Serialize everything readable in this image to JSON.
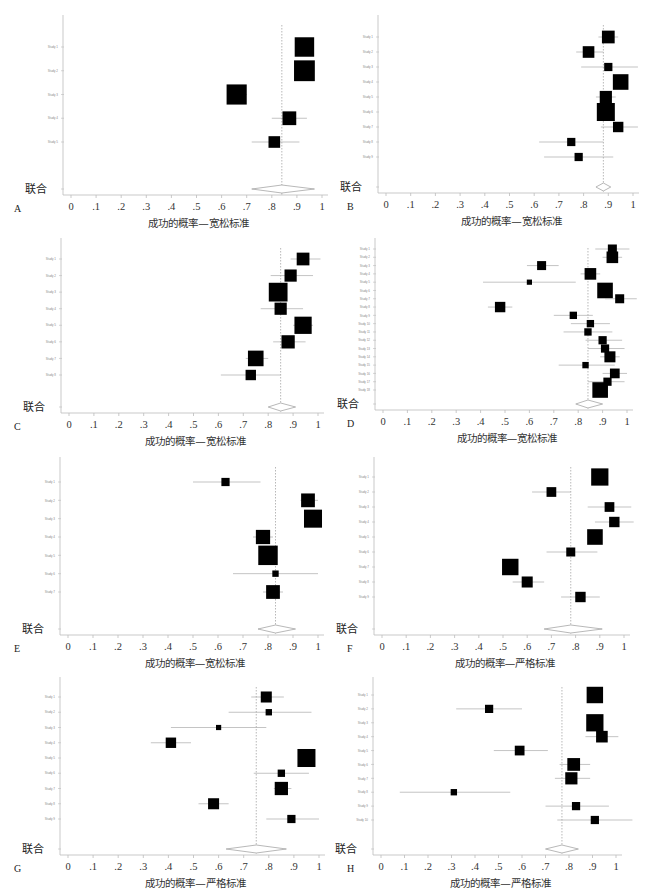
{
  "figure": {
    "pooled_label": "联合",
    "xlabel_lenient": "成功的概率—宽松标准",
    "xlabel_strict": "成功的概率—严格标准",
    "xticks": [
      "0",
      ".1",
      ".2",
      ".3",
      ".4",
      ".5",
      ".6",
      ".7",
      ".8",
      ".9",
      "1"
    ]
  },
  "chart_data": [
    {
      "panel": "A",
      "type": "forest",
      "xlabel": "成功的概率—宽松标准",
      "xlim": [
        0,
        1
      ],
      "reference_line": 0.84,
      "studies": [
        {
          "label": "Study 1",
          "est": 0.93,
          "lo": 0.9,
          "hi": 0.96,
          "weight": 14
        },
        {
          "label": "Study 2",
          "est": 0.93,
          "lo": 0.89,
          "hi": 0.97,
          "weight": 16
        },
        {
          "label": "Study 3",
          "est": 0.66,
          "lo": 0.63,
          "hi": 0.7,
          "weight": 15
        },
        {
          "label": "Study 4",
          "est": 0.87,
          "lo": 0.8,
          "hi": 0.94,
          "weight": 7
        },
        {
          "label": "Study 5",
          "est": 0.81,
          "lo": 0.72,
          "hi": 0.91,
          "weight": 5
        }
      ],
      "pooled": {
        "est": 0.84,
        "lo": 0.72,
        "hi": 0.97
      }
    },
    {
      "panel": "B",
      "type": "forest",
      "xlabel": "成功的概率—宽松标准",
      "xlim": [
        0,
        1
      ],
      "reference_line": 0.88,
      "studies": [
        {
          "label": "Study 1",
          "est": 0.9,
          "lo": 0.86,
          "hi": 0.94,
          "weight": 6
        },
        {
          "label": "Study 2",
          "est": 0.82,
          "lo": 0.77,
          "hi": 0.88,
          "weight": 5
        },
        {
          "label": "Study 3",
          "est": 0.9,
          "lo": 0.79,
          "hi": 1.02,
          "weight": 2.5
        },
        {
          "label": "Study 4",
          "est": 0.95,
          "lo": 0.93,
          "hi": 0.98,
          "weight": 9
        },
        {
          "label": "Study 5",
          "est": 0.89,
          "lo": 0.85,
          "hi": 0.93,
          "weight": 5.5
        },
        {
          "label": "Study 6",
          "est": 0.89,
          "lo": 0.87,
          "hi": 0.91,
          "weight": 12
        },
        {
          "label": "Study 7",
          "est": 0.94,
          "lo": 0.87,
          "hi": 1.02,
          "weight": 4
        },
        {
          "label": "Study 8",
          "est": 0.75,
          "lo": 0.62,
          "hi": 0.88,
          "weight": 2.5
        },
        {
          "label": "Study 9",
          "est": 0.78,
          "lo": 0.64,
          "hi": 0.92,
          "weight": 2.5
        }
      ],
      "pooled": {
        "est": 0.88,
        "lo": 0.85,
        "hi": 0.91
      }
    },
    {
      "panel": "C",
      "type": "forest",
      "xlabel": "成功的概率—宽松标准",
      "xlim": [
        0,
        1
      ],
      "reference_line": 0.85,
      "studies": [
        {
          "label": "Study 1",
          "est": 0.94,
          "lo": 0.89,
          "hi": 1.01,
          "weight": 6
        },
        {
          "label": "Study 2",
          "est": 0.89,
          "lo": 0.81,
          "hi": 0.98,
          "weight": 5.5
        },
        {
          "label": "Study 3",
          "est": 0.84,
          "lo": 0.82,
          "hi": 0.87,
          "weight": 13
        },
        {
          "label": "Study 4",
          "est": 0.85,
          "lo": 0.77,
          "hi": 0.94,
          "weight": 5.5
        },
        {
          "label": "Study 5",
          "est": 0.94,
          "lo": 0.9,
          "hi": 0.98,
          "weight": 11
        },
        {
          "label": "Study 6",
          "est": 0.88,
          "lo": 0.82,
          "hi": 0.95,
          "weight": 6.5
        },
        {
          "label": "Study 7",
          "est": 0.75,
          "lo": 0.71,
          "hi": 0.8,
          "weight": 9
        },
        {
          "label": "Study 8",
          "est": 0.73,
          "lo": 0.61,
          "hi": 0.85,
          "weight": 4
        }
      ],
      "pooled": {
        "est": 0.85,
        "lo": 0.8,
        "hi": 0.91
      }
    },
    {
      "panel": "D",
      "type": "forest",
      "xlabel": "成功的概率—宽松标准",
      "xlim": [
        0,
        1
      ],
      "reference_line": 0.84,
      "studies": [
        {
          "label": "Study 1",
          "est": 0.94,
          "lo": 0.87,
          "hi": 1.01,
          "weight": 3
        },
        {
          "label": "Study 2",
          "est": 0.94,
          "lo": 0.9,
          "hi": 0.98,
          "weight": 5
        },
        {
          "label": "Study 3",
          "est": 0.65,
          "lo": 0.59,
          "hi": 0.72,
          "weight": 3
        },
        {
          "label": "Study 4",
          "est": 0.85,
          "lo": 0.81,
          "hi": 0.89,
          "weight": 5
        },
        {
          "label": "Study 5",
          "est": 0.6,
          "lo": 0.41,
          "hi": 0.79,
          "weight": 1
        },
        {
          "label": "Study 6",
          "est": 0.91,
          "lo": 0.89,
          "hi": 0.93,
          "weight": 9
        },
        {
          "label": "Study 7",
          "est": 0.97,
          "lo": 0.91,
          "hi": 1.04,
          "weight": 3
        },
        {
          "label": "Study 8",
          "est": 0.48,
          "lo": 0.43,
          "hi": 0.53,
          "weight": 4
        },
        {
          "label": "Study 9",
          "est": 0.78,
          "lo": 0.7,
          "hi": 0.86,
          "weight": 2
        },
        {
          "label": "Study 10",
          "est": 0.85,
          "lo": 0.77,
          "hi": 0.93,
          "weight": 2
        },
        {
          "label": "Study 11",
          "est": 0.84,
          "lo": 0.74,
          "hi": 0.94,
          "weight": 2
        },
        {
          "label": "Study 12",
          "est": 0.9,
          "lo": 0.83,
          "hi": 0.98,
          "weight": 2.5
        },
        {
          "label": "Study 13",
          "est": 0.91,
          "lo": 0.84,
          "hi": 0.99,
          "weight": 2.5
        },
        {
          "label": "Study 14",
          "est": 0.93,
          "lo": 0.89,
          "hi": 0.97,
          "weight": 4.5
        },
        {
          "label": "Study 15",
          "est": 0.83,
          "lo": 0.72,
          "hi": 0.95,
          "weight": 1.5
        },
        {
          "label": "Study 16",
          "est": 0.95,
          "lo": 0.9,
          "hi": 1.0,
          "weight": 3.5
        },
        {
          "label": "Study 17",
          "est": 0.92,
          "lo": 0.84,
          "hi": 0.99,
          "weight": 2.5
        },
        {
          "label": "Study 18",
          "est": 0.89,
          "lo": 0.87,
          "hi": 0.91,
          "weight": 9
        }
      ],
      "pooled": {
        "est": 0.84,
        "lo": 0.79,
        "hi": 0.9
      }
    },
    {
      "panel": "E",
      "type": "forest",
      "xlabel": "成功的概率—宽松标准",
      "xlim": [
        0,
        1
      ],
      "reference_line": 0.83,
      "studies": [
        {
          "label": "Study 1",
          "est": 0.63,
          "lo": 0.5,
          "hi": 0.77,
          "weight": 2.5
        },
        {
          "label": "Study 2",
          "est": 0.96,
          "lo": 0.93,
          "hi": 1.0,
          "weight": 7
        },
        {
          "label": "Study 3",
          "est": 0.98,
          "lo": 0.96,
          "hi": 1.0,
          "weight": 12
        },
        {
          "label": "Study 4",
          "est": 0.78,
          "lo": 0.74,
          "hi": 0.82,
          "weight": 7.5
        },
        {
          "label": "Study 5",
          "est": 0.8,
          "lo": 0.78,
          "hi": 0.83,
          "weight": 14
        },
        {
          "label": "Study 6",
          "est": 0.83,
          "lo": 0.66,
          "hi": 1.0,
          "weight": 1.5
        },
        {
          "label": "Study 7",
          "est": 0.82,
          "lo": 0.78,
          "hi": 0.86,
          "weight": 7
        }
      ],
      "pooled": {
        "est": 0.83,
        "lo": 0.76,
        "hi": 0.91
      }
    },
    {
      "panel": "F",
      "type": "forest",
      "xlabel": "成功的概率—严格标准",
      "xlim": [
        0,
        1
      ],
      "reference_line": 0.78,
      "studies": [
        {
          "label": "Study 1",
          "est": 0.9,
          "lo": 0.88,
          "hi": 0.92,
          "weight": 11
        },
        {
          "label": "Study 2",
          "est": 0.7,
          "lo": 0.62,
          "hi": 0.78,
          "weight": 3.5
        },
        {
          "label": "Study 3",
          "est": 0.94,
          "lo": 0.85,
          "hi": 1.03,
          "weight": 3.5
        },
        {
          "label": "Study 4",
          "est": 0.96,
          "lo": 0.88,
          "hi": 1.04,
          "weight": 4
        },
        {
          "label": "Study 5",
          "est": 0.88,
          "lo": 0.86,
          "hi": 0.9,
          "weight": 9
        },
        {
          "label": "Study 6",
          "est": 0.78,
          "lo": 0.68,
          "hi": 0.89,
          "weight": 3
        },
        {
          "label": "Study 7",
          "est": 0.53,
          "lo": 0.51,
          "hi": 0.55,
          "weight": 10
        },
        {
          "label": "Study 8",
          "est": 0.6,
          "lo": 0.54,
          "hi": 0.67,
          "weight": 4.5
        },
        {
          "label": "Study 9",
          "est": 0.82,
          "lo": 0.74,
          "hi": 0.9,
          "weight": 4
        }
      ],
      "pooled": {
        "est": 0.78,
        "lo": 0.67,
        "hi": 0.91
      }
    },
    {
      "panel": "G",
      "type": "forest",
      "xlabel": "成功的概率—严格标准",
      "xlim": [
        0,
        1
      ],
      "reference_line": 0.75,
      "studies": [
        {
          "label": "Study 1",
          "est": 0.79,
          "lo": 0.73,
          "hi": 0.86,
          "weight": 4.5
        },
        {
          "label": "Study 2",
          "est": 0.8,
          "lo": 0.64,
          "hi": 0.97,
          "weight": 1.5
        },
        {
          "label": "Study 3",
          "est": 0.6,
          "lo": 0.41,
          "hi": 0.79,
          "weight": 1
        },
        {
          "label": "Study 4",
          "est": 0.41,
          "lo": 0.33,
          "hi": 0.49,
          "weight": 4
        },
        {
          "label": "Study 5",
          "est": 0.95,
          "lo": 0.93,
          "hi": 0.97,
          "weight": 12
        },
        {
          "label": "Study 6",
          "est": 0.85,
          "lo": 0.74,
          "hi": 0.96,
          "weight": 2
        },
        {
          "label": "Study 7",
          "est": 0.85,
          "lo": 0.82,
          "hi": 0.89,
          "weight": 6.5
        },
        {
          "label": "Study 8",
          "est": 0.58,
          "lo": 0.52,
          "hi": 0.64,
          "weight": 4.5
        },
        {
          "label": "Study 9",
          "est": 0.89,
          "lo": 0.79,
          "hi": 1.0,
          "weight": 2.5
        }
      ],
      "pooled": {
        "est": 0.75,
        "lo": 0.63,
        "hi": 0.87
      }
    },
    {
      "panel": "H",
      "type": "forest",
      "xlabel": "成功的概率—严格标准",
      "xlim": [
        0,
        1
      ],
      "reference_line": 0.77,
      "studies": [
        {
          "label": "Study 1",
          "est": 0.91,
          "lo": 0.89,
          "hi": 0.93,
          "weight": 10
        },
        {
          "label": "Study 2",
          "est": 0.46,
          "lo": 0.32,
          "hi": 0.6,
          "weight": 2.5
        },
        {
          "label": "Study 3",
          "est": 0.91,
          "lo": 0.89,
          "hi": 0.93,
          "weight": 11
        },
        {
          "label": "Study 4",
          "est": 0.94,
          "lo": 0.87,
          "hi": 1.01,
          "weight": 5
        },
        {
          "label": "Study 5",
          "est": 0.59,
          "lo": 0.48,
          "hi": 0.71,
          "weight": 3.5
        },
        {
          "label": "Study 6",
          "est": 0.82,
          "lo": 0.76,
          "hi": 0.89,
          "weight": 6
        },
        {
          "label": "Study 7",
          "est": 0.81,
          "lo": 0.74,
          "hi": 0.89,
          "weight": 5.5
        },
        {
          "label": "Study 8",
          "est": 0.31,
          "lo": 0.08,
          "hi": 0.55,
          "weight": 1.5
        },
        {
          "label": "Study 9",
          "est": 0.83,
          "lo": 0.7,
          "hi": 0.97,
          "weight": 2.5
        },
        {
          "label": "Study 10",
          "est": 0.91,
          "lo": 0.75,
          "hi": 1.07,
          "weight": 2.5
        }
      ],
      "pooled": {
        "est": 0.77,
        "lo": 0.7,
        "hi": 0.84
      }
    }
  ]
}
